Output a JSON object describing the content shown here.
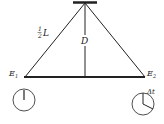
{
  "labels": {
    "half": "1",
    "half_den": "2",
    "half_L": "L",
    "D": "D",
    "E1": "E",
    "E1_sub": "1",
    "E2": "E",
    "E2_sub": "2",
    "delta_t": "Δt"
  },
  "colors": {
    "line": "#222222",
    "background": "#ffffff"
  }
}
